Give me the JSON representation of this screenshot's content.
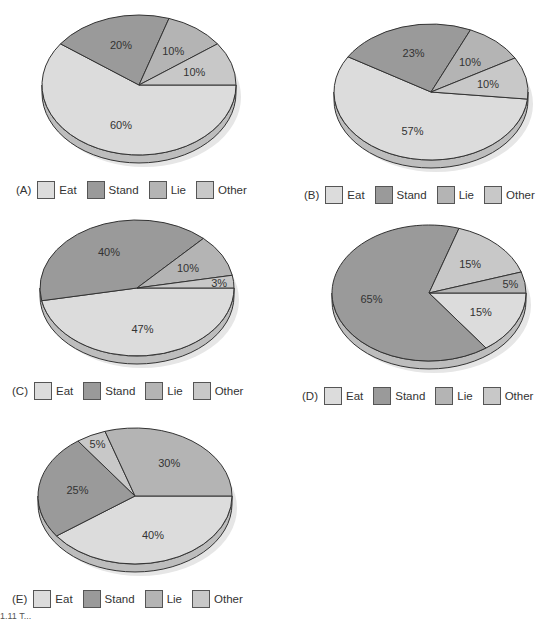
{
  "colors": {
    "eat": "#dcdcdc",
    "stand": "#9a9a9a",
    "lie": "#b4b4b4",
    "other": "#c8c8c8",
    "outline": "#333333"
  },
  "legend_labels": [
    "Eat",
    "Stand",
    "Lie",
    "Other"
  ],
  "caption": "1.11 T...",
  "chart_data": [
    {
      "type": "pie",
      "title": "(A)",
      "categories": [
        "Eat",
        "Stand",
        "Lie",
        "Other"
      ],
      "values": [
        60,
        20,
        10,
        10
      ],
      "labels": [
        "60%",
        "20%",
        "10%",
        "10%"
      ],
      "legend_position": "bottom"
    },
    {
      "type": "pie",
      "title": "(B)",
      "categories": [
        "Eat",
        "Stand",
        "Lie",
        "Other"
      ],
      "values": [
        57,
        23,
        10,
        10
      ],
      "labels": [
        "57%",
        "23%",
        "10%",
        "10%"
      ],
      "legend_position": "bottom"
    },
    {
      "type": "pie",
      "title": "(C)",
      "categories": [
        "Eat",
        "Stand",
        "Lie",
        "Other"
      ],
      "values": [
        47,
        40,
        10,
        3
      ],
      "labels": [
        "47%",
        "40%",
        "10%",
        "3%"
      ],
      "legend_position": "bottom"
    },
    {
      "type": "pie",
      "title": "(D)",
      "categories": [
        "Eat",
        "Stand",
        "Lie",
        "Other"
      ],
      "values": [
        15,
        65,
        15,
        5
      ],
      "labels": [
        "15%",
        "65%",
        "15%",
        "5%"
      ],
      "legend_position": "bottom"
    },
    {
      "type": "pie",
      "title": "(E)",
      "categories": [
        "Eat",
        "Stand",
        "Lie",
        "Other"
      ],
      "values": [
        40,
        25,
        5,
        30
      ],
      "labels": [
        "40%",
        "25%",
        "5%",
        "30%"
      ],
      "legend_position": "bottom"
    }
  ],
  "panels": [
    {
      "tag": "(A)"
    },
    {
      "tag": "(B)"
    },
    {
      "tag": "(C)"
    },
    {
      "tag": "(D)"
    },
    {
      "tag": "(E)"
    }
  ]
}
